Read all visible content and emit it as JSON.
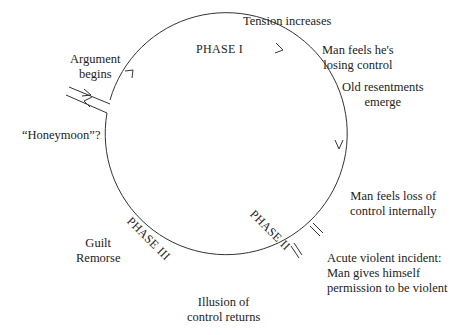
{
  "diagram": {
    "type": "cycle",
    "phases": [
      {
        "id": "phase-1",
        "label": "PHASE I"
      },
      {
        "id": "phase-2",
        "label": "PHASE II"
      },
      {
        "id": "phase-3",
        "label": "PHASE III"
      }
    ],
    "annotations": {
      "argument_begins": [
        "Argument",
        "begins"
      ],
      "tension_increases": "Tension increases",
      "losing_control": [
        "Man feels he's",
        "losing control"
      ],
      "old_resentments": [
        "Old resentments",
        "emerge"
      ],
      "loss_internal": [
        "Man feels loss of",
        "control internally"
      ],
      "acute_incident": [
        "Acute violent incident:",
        "Man gives himself",
        "permission to be violent"
      ],
      "illusion_control": [
        "Illusion of",
        "control returns"
      ],
      "guilt_remorse": [
        "Guilt",
        "Remorse"
      ],
      "honeymoon": "“Honeymoon”?"
    }
  }
}
